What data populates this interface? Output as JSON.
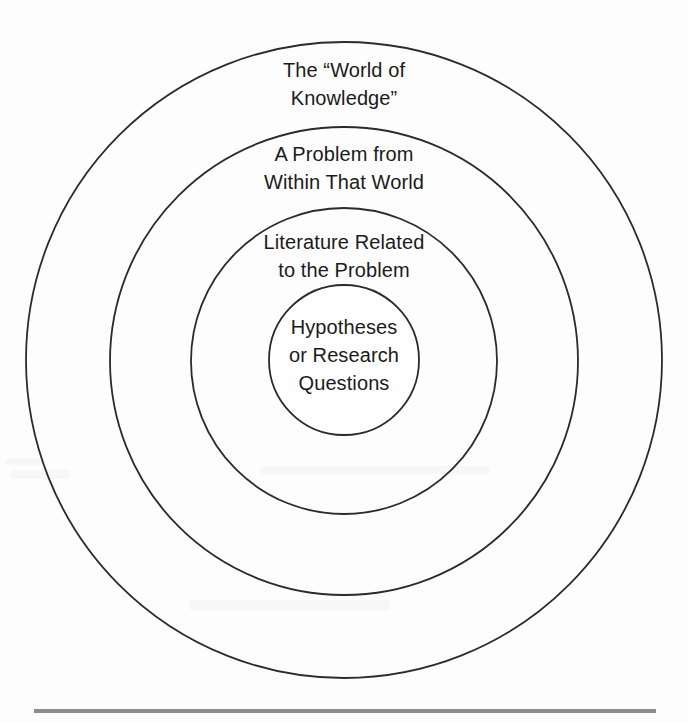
{
  "figure": {
    "name": "concentric-rings-research-framing",
    "background_color": "#fdfdfd",
    "stroke_color": "#2b2b2b",
    "text_color": "#1b1b1b",
    "rule_color": "#8d8d8d"
  },
  "rings": [
    {
      "id": "outer",
      "label": "The “World of\nKnowledge”",
      "center_x": 344,
      "center_y": 360,
      "radius": 318
    },
    {
      "id": "second",
      "label": "A Problem from\nWithin That World",
      "center_x": 344,
      "center_y": 361,
      "radius": 234
    },
    {
      "id": "third",
      "label": "Literature Related\nto the Problem",
      "center_x": 344,
      "center_y": 361,
      "radius": 153
    },
    {
      "id": "core",
      "label": "Hypotheses\nor Research\nQuestions",
      "center_x": 344,
      "center_y": 360,
      "radius": 75
    }
  ],
  "footer_rule": {
    "x1": 34,
    "x2": 656,
    "y": 711,
    "thickness": 4
  }
}
